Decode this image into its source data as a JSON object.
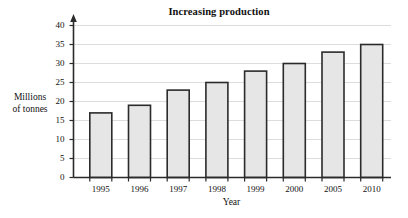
{
  "chart_data": {
    "type": "bar",
    "title": "Increasing production",
    "xlabel": "Year",
    "ylabel_lines": [
      "Millions",
      "of tonnes"
    ],
    "ylabel": "Millions of tonnes",
    "categories": [
      "1995",
      "1996",
      "1997",
      "1998",
      "1999",
      "2000",
      "2005",
      "2010"
    ],
    "values": [
      17,
      19,
      23,
      25,
      28,
      30,
      33,
      35
    ],
    "ylim": [
      0,
      40
    ],
    "ytick_labels": [
      "0",
      "5",
      "10",
      "15",
      "20",
      "25",
      "30",
      "35",
      "40"
    ],
    "ytick_values": [
      0,
      5,
      10,
      15,
      20,
      25,
      30,
      35,
      40
    ],
    "ytick_step": 5,
    "grid": "horizontal",
    "legend": null,
    "series": [
      {
        "name": "Production",
        "values": [
          17,
          19,
          23,
          25,
          28,
          30,
          33,
          35
        ]
      }
    ],
    "colors": {
      "bar_fill": "#e6e6e6",
      "bar_stroke": "#2b2b2b",
      "axis": "#2b2b2b",
      "grid": "#dcdcdc",
      "background": "#ffffff",
      "text": "#111111"
    },
    "axis_arrow": "up-arrow-y-axis"
  }
}
